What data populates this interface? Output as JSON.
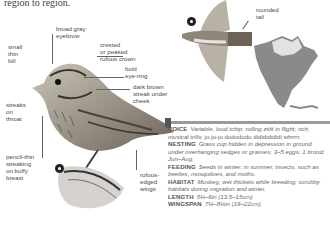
{
  "intro_text": "region to region.",
  "labels": {
    "bill": "small thin bill",
    "eyebrow": "broad gray eyebrow",
    "crown": "crested or peaked rufous crown",
    "eye_ring": "bold eye-ring",
    "cheek": "dark brown streak under cheek",
    "throat": "streaks on throat",
    "breast": "pencil-thin streaking on buffy breast",
    "wings": "rufous-edged wings",
    "tail": "rounded tail"
  },
  "label_lines": {
    "bill": [
      "small",
      "thin",
      "bill"
    ],
    "eyebrow": [
      "broad gray",
      "eyebrow"
    ],
    "crown": [
      "crested",
      "or peaked",
      "rufous crown"
    ],
    "eye_ring": [
      "bold",
      "eye-ring"
    ],
    "cheek": [
      "dark brown",
      "streak under",
      "cheek"
    ],
    "throat": [
      "streaks",
      "on",
      "throat"
    ],
    "breast": [
      "pencil-thin",
      "streaking",
      "on buffy",
      "breast"
    ],
    "wings": [
      "rufous-",
      "edged",
      "wings"
    ],
    "tail": [
      "rounded",
      "tail"
    ]
  },
  "info": [
    {
      "key": "VOICE",
      "value": "Variable, loud tchip; rolling ziiiit in flight; rich, musical trills: ",
      "extra": "ju-ju-ju dodododo didididididi whrrrr."
    },
    {
      "key": "NESTING",
      "value": "Grass cup hidden in depression in ground under overhanging sedges or grasses; 3–5 eggs; 1 brood; Jun–Aug."
    },
    {
      "key": "FEEDING",
      "value": "Seeds in winter; in summer, insects, such as beetles, mosquitoes, and moths."
    },
    {
      "key": "HABITAT",
      "value": "Muskeg, wet thickets while breeding; scrubby habitats during migration and winter."
    },
    {
      "key": "LENGTH",
      "value": "5¼–6in (13.5–15cm)"
    },
    {
      "key": "WINGSPAN",
      "value": "7¼–8¼in (19–22cm)"
    }
  ],
  "figures": {
    "perched_bird": "Lincoln's sparrow illustration (perched, side view)",
    "flying_bird": "sparrow in flight (from below)",
    "range_map": "North America range map"
  },
  "icons": [
    "male-female-symbol-icon",
    "male-female-symbol-icon"
  ]
}
